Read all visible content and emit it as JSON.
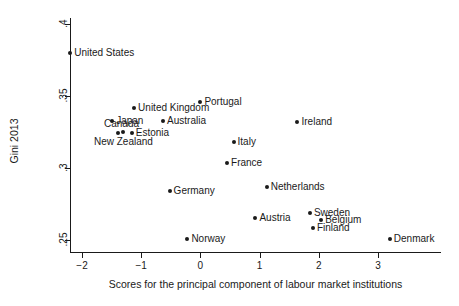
{
  "chart_data": {
    "type": "scatter",
    "title": "",
    "xlabel": "Scores for the principal component of labour market institutions",
    "ylabel": "Gini 2013",
    "xlim": [
      -2.45,
      3.55
    ],
    "ylim": [
      0.2435,
      0.4055
    ],
    "grid": false,
    "legend": "none",
    "xticks": [
      -2,
      -1,
      0,
      1,
      2,
      3
    ],
    "xtick_labels": [
      "−2",
      "−1",
      "0",
      "1",
      "2",
      "3"
    ],
    "yticks": [
      0.25,
      0.3,
      0.35,
      0.4
    ],
    "ytick_labels": [
      ".25",
      ".3",
      ".35",
      ".4"
    ],
    "points": [
      {
        "label": "United States",
        "x": -2.2,
        "y": 0.38,
        "label_pos": "right"
      },
      {
        "label": "Japan",
        "x": -1.49,
        "y": 0.3325,
        "label_pos": "right"
      },
      {
        "label": "United Kingdom",
        "x": -1.12,
        "y": 0.342,
        "label_pos": "right"
      },
      {
        "label": "Australia",
        "x": -0.63,
        "y": 0.3325,
        "label_pos": "right"
      },
      {
        "label": "Canada",
        "x": -1.4,
        "y": 0.324,
        "label_pos": "above-left"
      },
      {
        "label": "New Zealand",
        "x": -1.3,
        "y": 0.325,
        "label_pos": "below"
      },
      {
        "label": "Estonia",
        "x": -1.16,
        "y": 0.324,
        "label_pos": "right"
      },
      {
        "label": "Portugal",
        "x": 0.0,
        "y": 0.3455,
        "label_pos": "right"
      },
      {
        "label": "Ireland",
        "x": 1.64,
        "y": 0.332,
        "label_pos": "right"
      },
      {
        "label": "Italy",
        "x": 0.56,
        "y": 0.318,
        "label_pos": "right"
      },
      {
        "label": "France",
        "x": 0.45,
        "y": 0.3035,
        "label_pos": "right"
      },
      {
        "label": "Germany",
        "x": -0.52,
        "y": 0.284,
        "label_pos": "right"
      },
      {
        "label": "Netherlands",
        "x": 1.12,
        "y": 0.287,
        "label_pos": "right"
      },
      {
        "label": "Austria",
        "x": 0.93,
        "y": 0.265,
        "label_pos": "right"
      },
      {
        "label": "Sweden",
        "x": 1.85,
        "y": 0.269,
        "label_pos": "right"
      },
      {
        "label": "Belgium",
        "x": 2.04,
        "y": 0.264,
        "label_pos": "right"
      },
      {
        "label": "Finland",
        "x": 1.9,
        "y": 0.2585,
        "label_pos": "right"
      },
      {
        "label": "Norway",
        "x": -0.22,
        "y": 0.251,
        "label_pos": "right"
      },
      {
        "label": "Denmark",
        "x": 3.2,
        "y": 0.251,
        "label_pos": "right"
      }
    ]
  },
  "colors": {
    "marker": "#1a1a1a",
    "axis": "#1a1a1a",
    "background": "#ffffff"
  }
}
